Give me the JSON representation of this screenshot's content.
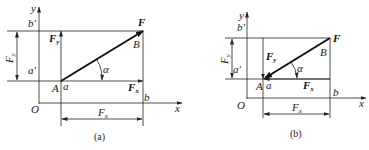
{
  "diagrams": [
    {
      "caption": "(a)",
      "labels": {
        "y_axis": "y",
        "x_axis": "x",
        "origin": "O",
        "b_prime": "b'",
        "a_prime": "a'",
        "force": "F",
        "point_B": "B",
        "point_A": "A",
        "point_a": "a",
        "point_b": "b",
        "angle": "α",
        "Fy_main": "F",
        "Fy_sub": "y",
        "Fx_main": "F",
        "Fx_sub": "x",
        "dim_Fy_main": "F",
        "dim_Fy_sub": "y",
        "dim_Fx_main": "F",
        "dim_Fx_sub": "x"
      }
    },
    {
      "caption": "(b)",
      "labels": {
        "y_axis": "y",
        "x_axis": "x",
        "origin": "O",
        "b_prime": "b'",
        "a_prime": "a'",
        "force": "F",
        "point_B": "B",
        "point_A": "A",
        "point_a": "a",
        "point_b": "b",
        "angle": "α",
        "Fy_main": "F",
        "Fy_sub": "y",
        "Fx_main": "F",
        "Fx_sub": "x",
        "dim_Fy_main": "F",
        "dim_Fy_sub": "y",
        "dim_Fx_main": "F",
        "dim_Fx_sub": "x"
      }
    }
  ]
}
